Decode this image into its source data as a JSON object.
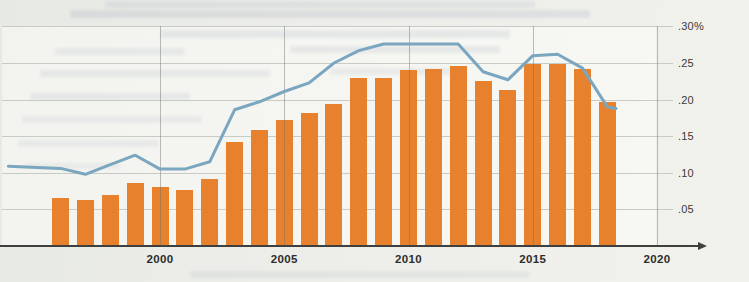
{
  "chart_data": {
    "type": "combo",
    "title": "",
    "unit": "percent",
    "ylim": [
      0,
      0.3
    ],
    "grid": "horizontal at .05 steps to right axis; vertical at 5-year ticks",
    "legend": "none",
    "categories": [
      1996,
      1997,
      1998,
      1999,
      2000,
      2001,
      2002,
      2003,
      2004,
      2005,
      2006,
      2007,
      2008,
      2009,
      2010,
      2011,
      2012,
      2013,
      2014,
      2015,
      2016,
      2017,
      2018
    ],
    "series": [
      {
        "name": "annual-rate-bars",
        "type": "bar",
        "color": "#e8812d",
        "values": [
          0.066,
          0.063,
          0.069,
          0.086,
          0.081,
          0.076,
          0.091,
          0.142,
          0.158,
          0.172,
          0.182,
          0.194,
          0.229,
          0.229,
          0.24,
          0.242,
          0.246,
          0.226,
          0.213,
          0.248,
          0.249,
          0.242,
          0.197
        ]
      },
      {
        "name": "trend-line",
        "type": "line",
        "color": "#7aa6c0",
        "points": [
          [
            1993.9,
            0.109
          ],
          [
            1996,
            0.106
          ],
          [
            1997,
            0.098
          ],
          [
            1998,
            0.111
          ],
          [
            1999,
            0.124
          ],
          [
            2000,
            0.105
          ],
          [
            2001,
            0.105
          ],
          [
            2002,
            0.115
          ],
          [
            2003,
            0.186
          ],
          [
            2004,
            0.197
          ],
          [
            2005,
            0.211
          ],
          [
            2006,
            0.223
          ],
          [
            2007,
            0.25
          ],
          [
            2008,
            0.267
          ],
          [
            2009,
            0.276
          ],
          [
            2010,
            0.276
          ],
          [
            2011,
            0.276
          ],
          [
            2012,
            0.276
          ],
          [
            2013,
            0.238
          ],
          [
            2014,
            0.227
          ],
          [
            2015,
            0.26
          ],
          [
            2016,
            0.262
          ],
          [
            2017,
            0.243
          ],
          [
            2018,
            0.19
          ],
          [
            2018.35,
            0.188
          ]
        ]
      }
    ],
    "yticks": [
      {
        "value": 0.3,
        "label": ".30%"
      },
      {
        "value": 0.25,
        "label": ".25"
      },
      {
        "value": 0.2,
        "label": ".20"
      },
      {
        "value": 0.15,
        "label": ".15"
      },
      {
        "value": 0.1,
        "label": ".10"
      },
      {
        "value": 0.05,
        "label": ".05"
      }
    ],
    "xticks": [
      {
        "value": 2000,
        "label": "2000"
      },
      {
        "value": 2005,
        "label": "2005"
      },
      {
        "value": 2010,
        "label": "2010"
      },
      {
        "value": 2015,
        "label": "2015"
      },
      {
        "value": 2020,
        "label": "2020"
      }
    ]
  }
}
